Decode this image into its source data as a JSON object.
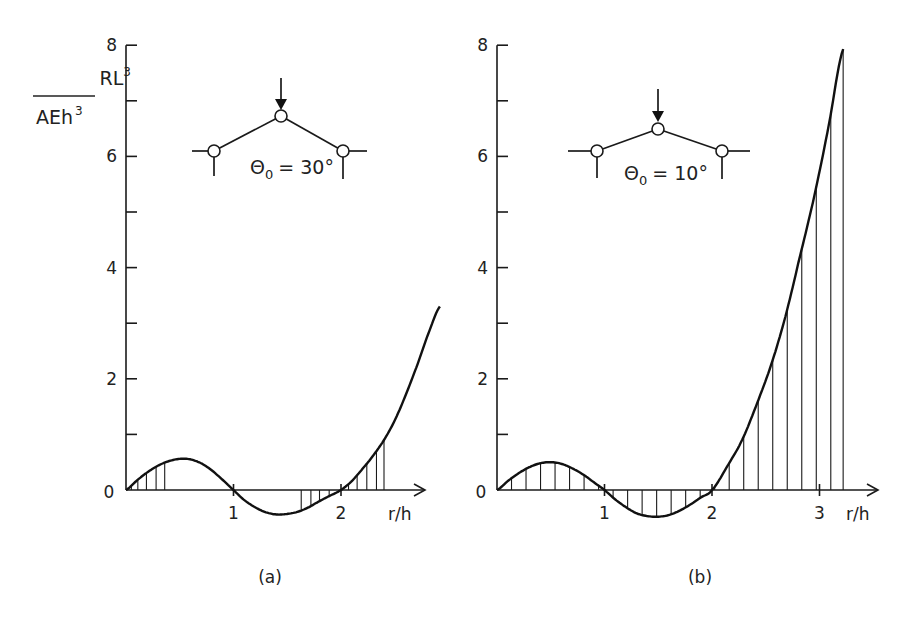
{
  "chart_data": [
    {
      "type": "line",
      "panel_caption": "(a)",
      "title": "",
      "ylabel_numerator": "RL",
      "ylabel_numerator_sup": "3",
      "ylabel_denominator": "AEh",
      "ylabel_denominator_sup": "3",
      "xlabel": "r/h",
      "ylim": [
        0,
        8
      ],
      "xlim": [
        0,
        2.8
      ],
      "yticks_major": [
        "0",
        "2",
        "4",
        "6",
        "8"
      ],
      "yticks_minor_values": [
        1,
        3,
        5,
        7
      ],
      "xticks": [
        "1",
        "2"
      ],
      "origin_label": "0",
      "grid": false,
      "inset_label": "Θ0 = 30°",
      "inset_angle_symbol": "Θ",
      "inset_angle_sub": "0",
      "inset_angle_value": "= 30°",
      "series": [
        {
          "name": "RL^3/AEh^3",
          "x": [
            0,
            0.1,
            0.2,
            0.3,
            0.4,
            0.5,
            0.6,
            0.7,
            0.8,
            0.9,
            1.0,
            1.1,
            1.2,
            1.3,
            1.4,
            1.5,
            1.6,
            1.7,
            1.8,
            1.9,
            2.0,
            2.1,
            2.2,
            2.3,
            2.4,
            2.5,
            2.6,
            2.7,
            2.8,
            2.92
          ],
          "y": [
            0,
            0.17,
            0.32,
            0.44,
            0.52,
            0.56,
            0.55,
            0.48,
            0.35,
            0.18,
            0,
            -0.18,
            -0.31,
            -0.4,
            -0.44,
            -0.43,
            -0.39,
            -0.31,
            -0.2,
            -0.1,
            0,
            0.16,
            0.38,
            0.62,
            0.9,
            1.25,
            1.7,
            2.2,
            2.75,
            3.3
          ]
        }
      ],
      "hatched_ranges": [
        [
          0.05,
          0.36
        ],
        [
          1.63,
          1.98
        ],
        [
          2.05,
          2.4
        ]
      ]
    },
    {
      "type": "line",
      "panel_caption": "(b)",
      "title": "",
      "xlabel": "r/h",
      "ylim": [
        0,
        8
      ],
      "xlim": [
        0,
        3.55
      ],
      "yticks_major": [
        "0",
        "2",
        "4",
        "6",
        "8"
      ],
      "yticks_minor_values": [
        1,
        3,
        5,
        7
      ],
      "xticks": [
        "1",
        "2",
        "3"
      ],
      "origin_label": "0",
      "grid": false,
      "inset_label": "Θ0 = 10°",
      "inset_angle_symbol": "Θ",
      "inset_angle_sub": "0",
      "inset_angle_value": "= 10°",
      "series": [
        {
          "name": "RL^3/AEh^3",
          "x": [
            0,
            0.1,
            0.2,
            0.3,
            0.4,
            0.5,
            0.6,
            0.7,
            0.8,
            0.9,
            1.0,
            1.1,
            1.2,
            1.3,
            1.4,
            1.5,
            1.6,
            1.7,
            1.8,
            1.9,
            2.0,
            2.15,
            2.28,
            2.42,
            2.55,
            2.68,
            2.81,
            2.95,
            3.08,
            3.22
          ],
          "y": [
            0,
            0.16,
            0.3,
            0.41,
            0.48,
            0.5,
            0.47,
            0.39,
            0.28,
            0.14,
            0,
            -0.17,
            -0.31,
            -0.42,
            -0.47,
            -0.48,
            -0.45,
            -0.37,
            -0.26,
            -0.13,
            0,
            0.45,
            0.9,
            1.56,
            2.25,
            3.1,
            4.14,
            5.27,
            6.5,
            7.93
          ]
        }
      ],
      "hatch_step": 0.135,
      "hatched_ranges": [
        [
          0.13,
          3.22
        ]
      ]
    }
  ]
}
